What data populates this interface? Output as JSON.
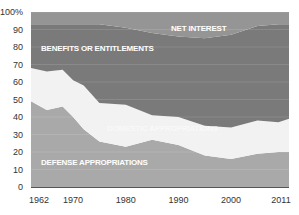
{
  "chart_data": {
    "type": "area",
    "stacked": true,
    "percent": true,
    "title": "",
    "xlabel": "",
    "ylabel": "",
    "x": [
      1962,
      1965,
      1968,
      1970,
      1972,
      1975,
      1980,
      1985,
      1990,
      1995,
      2000,
      2005,
      2009,
      2011
    ],
    "series": [
      {
        "name": "DEFENSE APPROPRIATIONS",
        "color": "#a9a9a9",
        "values": [
          49,
          44,
          46,
          40,
          33,
          26,
          23,
          27,
          24,
          18,
          16,
          19,
          20,
          20
        ]
      },
      {
        "name": "DOMESTIC APPROPRIATIONS",
        "color": "#f2f2f2",
        "values": [
          19,
          22,
          21,
          21,
          25,
          22,
          24,
          14,
          16,
          17,
          18,
          19,
          17,
          19
        ]
      },
      {
        "name": "BENEFITS OR ENTITLEMENTS",
        "color": "#7a7a7a",
        "values": [
          25,
          27,
          26,
          32,
          35,
          45,
          44,
          47,
          46,
          50,
          53,
          54,
          56,
          54
        ]
      },
      {
        "name": "NET INTEREST",
        "color": "#959595",
        "values": [
          7,
          7,
          7,
          7,
          7,
          7,
          9,
          12,
          14,
          15,
          13,
          8,
          7,
          7
        ]
      }
    ],
    "yticks": [
      "0",
      "10",
      "20",
      "30",
      "40",
      "50",
      "60",
      "70",
      "80",
      "90",
      "100%"
    ],
    "xticks": [
      "1962",
      "1970",
      "1980",
      "1990",
      "2000",
      "2011"
    ],
    "ylim": [
      0,
      100
    ],
    "xlim": [
      1962,
      2011
    ],
    "grid": true,
    "legend": "inline labels"
  },
  "labels": {
    "net_interest": "NET INTEREST",
    "benefits": "BENEFITS OR ENTITLEMENTS",
    "domestic": "DOMESTIC APPROPRIATIONS",
    "defense": "DEFENSE APPROPRIATIONS"
  }
}
